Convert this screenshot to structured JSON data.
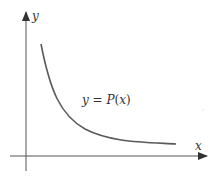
{
  "diagram": {
    "y_axis_label": "y",
    "x_axis_label": "x",
    "curve_label_prefix": "y = ",
    "curve_label_func": "P",
    "curve_label_arg": "(x)",
    "colors": {
      "axis": "#555555",
      "curve": "#5a5a5a",
      "text": "#333333"
    }
  }
}
